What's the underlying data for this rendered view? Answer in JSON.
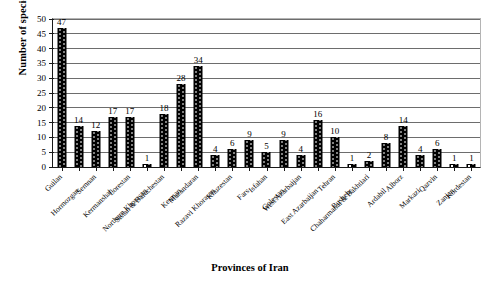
{
  "chart_data": {
    "type": "bar",
    "title": "",
    "xlabel": "Provinces of Iran",
    "ylabel": "Number of species",
    "ylim": [
      0,
      50
    ],
    "ytick_step": 5,
    "yticks": [
      0,
      5,
      10,
      15,
      20,
      25,
      30,
      35,
      40,
      45,
      50
    ],
    "ytick_labels": [
      "0",
      "5",
      "10",
      "15",
      "20",
      "25",
      "30",
      "35",
      "40",
      "45",
      "50"
    ],
    "grid": "horizontal",
    "legend": "none",
    "bar_fill": "#000000",
    "bar_pattern": "dotted",
    "gridline_color": "#6d6d6d",
    "axis_color": "#1a1a1a",
    "data_labels": true,
    "categories": [
      "Guilan",
      "Hormozgan",
      "Semnan",
      "Kermanshah",
      "Lorestan",
      "Northern Khorasan",
      "Sistan & Baluchestan",
      "Kerman",
      "Mazandaran",
      "Razavi Khorasan",
      "Khuzestan",
      "Fars",
      "Isfahan",
      "Golestan",
      "West Azarbaijan",
      "East Azarbaijan",
      "Tehran",
      "Bushehr",
      "Chaharmahal & Bakhtiari",
      "Ardabil",
      "Alborz",
      "Markazi",
      "Qazvin",
      "Zanjan",
      "Kordestan"
    ],
    "values": [
      47,
      14,
      12,
      17,
      17,
      1,
      18,
      28,
      34,
      4,
      6,
      9,
      5,
      9,
      4,
      16,
      10,
      1,
      2,
      8,
      14,
      4,
      6,
      1,
      1
    ]
  }
}
